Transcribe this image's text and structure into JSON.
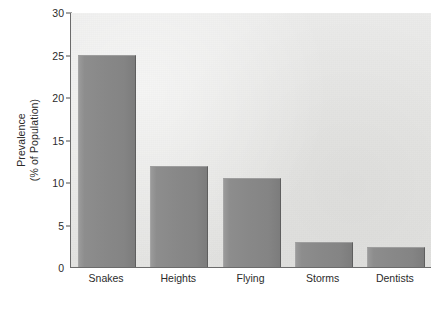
{
  "chart_data": {
    "type": "bar",
    "title": "",
    "xlabel": "",
    "ylabel": "Prevalence (% of Population)",
    "ylabel_line1": "Prevalence",
    "ylabel_line2": "(% of Population)",
    "categories": [
      "Snakes",
      "Heights",
      "Flying",
      "Storms",
      "Dentists"
    ],
    "values": [
      25.0,
      11.9,
      10.5,
      3.0,
      2.4
    ],
    "ylim": [
      0,
      30
    ],
    "yticks": [
      0,
      5,
      10,
      15,
      20,
      25,
      30
    ],
    "ytick_labels": [
      "0",
      "5",
      "10",
      "15",
      "20",
      "25",
      "30"
    ],
    "grid": false,
    "legend": null,
    "bar_color": "#888888",
    "plot_background": "#e8e8e6",
    "axis_color": "#6b6b6b",
    "text_color": "#2b2b2b"
  }
}
